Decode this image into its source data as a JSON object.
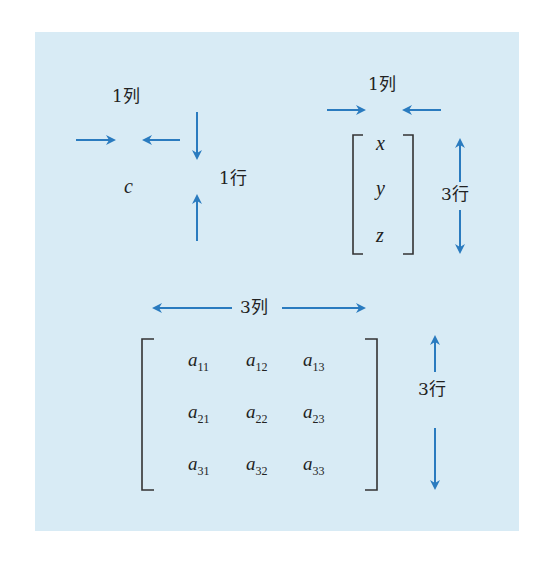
{
  "diagram": {
    "colors": {
      "background": "#d8ebf5",
      "arrow": "#2a7bbf",
      "text": "#222222",
      "bracket": "#333333"
    },
    "scalar": {
      "symbol": "c",
      "col_label": "1列",
      "row_label": "1行"
    },
    "vector": {
      "entries": [
        "x",
        "y",
        "z"
      ],
      "col_label": "1列",
      "row_label": "3行"
    },
    "matrix": {
      "col_label": "3列",
      "row_label": "3行",
      "rows": [
        [
          {
            "base": "a",
            "sub": "11"
          },
          {
            "base": "a",
            "sub": "12"
          },
          {
            "base": "a",
            "sub": "13"
          }
        ],
        [
          {
            "base": "a",
            "sub": "21"
          },
          {
            "base": "a",
            "sub": "22"
          },
          {
            "base": "a",
            "sub": "23"
          }
        ],
        [
          {
            "base": "a",
            "sub": "31"
          },
          {
            "base": "a",
            "sub": "32"
          },
          {
            "base": "a",
            "sub": "33"
          }
        ]
      ]
    }
  }
}
